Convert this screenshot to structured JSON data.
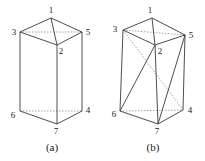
{
  "figures": [
    {
      "id": "a",
      "caption": "(a)",
      "caption_pos": [
        52,
        151
      ],
      "vertices": {
        "1": [
          51,
          18
        ],
        "2": [
          57,
          45
        ],
        "3": [
          20,
          32
        ],
        "4": [
          82,
          111
        ],
        "5": [
          82,
          32
        ],
        "6": [
          20,
          111
        ],
        "7": [
          57,
          124
        ]
      },
      "labels": {
        "1": [
          51,
          13
        ],
        "2": [
          61,
          54
        ],
        "3": [
          14,
          35
        ],
        "4": [
          88,
          113
        ],
        "5": [
          88,
          35
        ],
        "6": [
          13,
          118
        ],
        "7": [
          56,
          134
        ]
      },
      "solid_edges": [
        [
          1,
          3
        ],
        [
          1,
          5
        ],
        [
          1,
          2
        ],
        [
          3,
          2
        ],
        [
          2,
          5
        ],
        [
          3,
          6
        ],
        [
          2,
          7
        ],
        [
          5,
          4
        ],
        [
          6,
          7
        ],
        [
          7,
          4
        ]
      ],
      "dashed_edges": [
        [
          3,
          5
        ],
        [
          6,
          4
        ]
      ]
    },
    {
      "id": "b",
      "caption": "(b)",
      "caption_pos": [
        153,
        151
      ],
      "vertices": {
        "1": [
          152,
          18
        ],
        "2": [
          155,
          45
        ],
        "3": [
          123,
          30
        ],
        "4": [
          183,
          110
        ],
        "5": [
          185,
          35
        ],
        "6": [
          120,
          111
        ],
        "7": [
          158,
          124
        ]
      },
      "labels": {
        "1": [
          150,
          13
        ],
        "2": [
          160,
          54
        ],
        "3": [
          115,
          32
        ],
        "4": [
          190,
          113
        ],
        "5": [
          191,
          38
        ],
        "6": [
          114,
          117
        ],
        "7": [
          157,
          134
        ]
      },
      "solid_edges": [
        [
          1,
          3
        ],
        [
          1,
          5
        ],
        [
          1,
          2
        ],
        [
          3,
          2
        ],
        [
          2,
          5
        ],
        [
          3,
          6
        ],
        [
          2,
          7
        ],
        [
          5,
          4
        ],
        [
          6,
          7
        ],
        [
          7,
          4
        ],
        [
          2,
          6
        ],
        [
          5,
          7
        ]
      ],
      "dashed_edges": [
        [
          3,
          5
        ],
        [
          6,
          4
        ],
        [
          3,
          4
        ]
      ]
    }
  ]
}
